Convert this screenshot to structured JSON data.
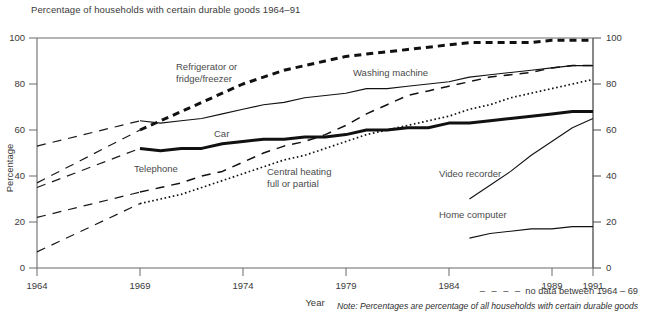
{
  "header": {
    "title": "Percentage of households with certain durable goods 1964–91"
  },
  "axes": {
    "ylabel": "Percentage",
    "xlabel": "Year",
    "y_ticks": [
      "0",
      "20",
      "40",
      "60",
      "80",
      "100"
    ],
    "y_ticks_right": [
      "0",
      "20",
      "40",
      "60",
      "80",
      "100"
    ],
    "x_ticks": [
      "1964",
      "1969",
      "1974",
      "1979",
      "1984",
      "1989",
      "1991"
    ]
  },
  "legend": {
    "dash_symbol": "– – – –",
    "dash_note": "no data between 1964 – 69",
    "footnote": "Note: Percentages are percentage of all households with certain durable goods"
  },
  "series_labels": {
    "refrigerator": "Refrigerator or",
    "refrigerator_line2": "fridge/freezer",
    "washing_machine": "Washing machine",
    "car": "Car",
    "telephone": "Telephone",
    "central_heating": "Central heating",
    "central_heating_line2": "full or partial",
    "video_recorder": "Video recorder",
    "home_computer": "Home computer"
  },
  "chart_data": {
    "type": "line",
    "title": "Percentage of households with certain durable goods 1964–91",
    "xlabel": "Year",
    "ylabel": "Percentage",
    "xlim": [
      1964,
      1991
    ],
    "ylim": [
      0,
      100
    ],
    "grid": false,
    "legend_position": "inline-labels",
    "xticks": [
      1964,
      1969,
      1974,
      1979,
      1984,
      1989,
      1991
    ],
    "yticks": [
      0,
      20,
      40,
      60,
      80,
      100
    ],
    "annotations": [
      "no data between 1964 – 69",
      "Note: Percentages are percentage of all households with certain durable goods"
    ],
    "series": [
      {
        "name": "Refrigerator or fridge/freezer",
        "style": "thick-dashed",
        "gap_1964_69": true,
        "x": [
          1964,
          1969,
          1970,
          1971,
          1972,
          1973,
          1974,
          1975,
          1976,
          1977,
          1978,
          1979,
          1980,
          1981,
          1982,
          1983,
          1984,
          1985,
          1986,
          1987,
          1988,
          1989,
          1990,
          1991
        ],
        "values": [
          37,
          60,
          64,
          68,
          72,
          76,
          80,
          83,
          86,
          88,
          90,
          92,
          93,
          94,
          95,
          96,
          97,
          98,
          98,
          98,
          98,
          99,
          99,
          99
        ]
      },
      {
        "name": "Washing machine",
        "style": "thin-solid",
        "gap_1964_69": true,
        "x": [
          1964,
          1969,
          1970,
          1971,
          1972,
          1973,
          1974,
          1975,
          1976,
          1977,
          1978,
          1979,
          1980,
          1981,
          1982,
          1983,
          1984,
          1985,
          1986,
          1987,
          1988,
          1989,
          1990,
          1991
        ],
        "values": [
          53,
          64,
          63,
          64,
          65,
          67,
          69,
          71,
          72,
          74,
          75,
          76,
          78,
          78,
          79,
          80,
          81,
          83,
          84,
          85,
          86,
          87,
          88,
          88
        ]
      },
      {
        "name": "Telephone",
        "style": "medium-dashed",
        "gap_1964_69": true,
        "x": [
          1964,
          1969,
          1970,
          1971,
          1972,
          1973,
          1974,
          1975,
          1976,
          1977,
          1978,
          1979,
          1980,
          1981,
          1982,
          1983,
          1984,
          1985,
          1986,
          1987,
          1988,
          1989,
          1990,
          1991
        ],
        "values": [
          22,
          33,
          35,
          37,
          40,
          42,
          46,
          50,
          53,
          55,
          58,
          62,
          67,
          71,
          75,
          77,
          79,
          81,
          83,
          84,
          85,
          87,
          88,
          88
        ]
      },
      {
        "name": "Car",
        "style": "thick-solid",
        "gap_1964_69": true,
        "x": [
          1964,
          1969,
          1970,
          1971,
          1972,
          1973,
          1974,
          1975,
          1976,
          1977,
          1978,
          1979,
          1980,
          1981,
          1982,
          1983,
          1984,
          1985,
          1986,
          1987,
          1988,
          1989,
          1990,
          1991
        ],
        "values": [
          35,
          52,
          51,
          52,
          52,
          54,
          55,
          56,
          56,
          57,
          57,
          58,
          60,
          60,
          61,
          61,
          63,
          63,
          64,
          65,
          66,
          67,
          68,
          68
        ]
      },
      {
        "name": "Central heating full or partial",
        "style": "dotted",
        "gap_1964_69": true,
        "x": [
          1964,
          1969,
          1970,
          1971,
          1972,
          1973,
          1974,
          1975,
          1976,
          1977,
          1978,
          1979,
          1980,
          1981,
          1982,
          1983,
          1984,
          1985,
          1986,
          1987,
          1988,
          1989,
          1990,
          1991
        ],
        "values": [
          7,
          28,
          30,
          32,
          35,
          38,
          41,
          44,
          47,
          49,
          52,
          55,
          58,
          60,
          62,
          64,
          66,
          69,
          71,
          74,
          76,
          78,
          80,
          82
        ]
      },
      {
        "name": "Video recorder",
        "style": "thin-solid",
        "gap_1964_69": false,
        "x": [
          1985,
          1986,
          1987,
          1988,
          1989,
          1990,
          1991
        ],
        "values": [
          30,
          36,
          42,
          49,
          55,
          61,
          65
        ]
      },
      {
        "name": "Home computer",
        "style": "thin-solid",
        "gap_1964_69": false,
        "x": [
          1985,
          1986,
          1987,
          1988,
          1989,
          1990,
          1991
        ],
        "values": [
          13,
          15,
          16,
          17,
          17,
          18,
          18
        ]
      }
    ]
  }
}
